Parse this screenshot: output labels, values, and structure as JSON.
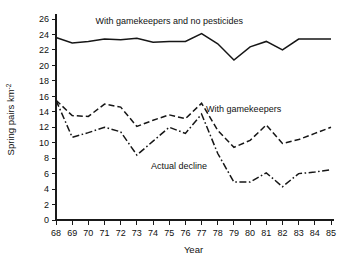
{
  "chart_data": {
    "type": "line",
    "title": "",
    "xlabel": "Year",
    "ylabel": "Spring pairs km",
    "ylabel_sup": "-2",
    "xlim": [
      68,
      85
    ],
    "ylim": [
      0,
      26
    ],
    "yticks": [
      0,
      2,
      4,
      6,
      8,
      10,
      12,
      14,
      16,
      18,
      20,
      22,
      24,
      26
    ],
    "ytick_labels": [
      "0",
      "2",
      "4",
      "6",
      "8",
      "10",
      "12",
      "14",
      "16",
      "18",
      "20",
      "22",
      "24",
      "26"
    ],
    "xticks": [
      68,
      69,
      70,
      71,
      72,
      73,
      74,
      75,
      76,
      77,
      78,
      79,
      80,
      81,
      82,
      83,
      84,
      85
    ],
    "xtick_labels": [
      "68",
      "69",
      "70",
      "71",
      "72",
      "73",
      "74",
      "75",
      "76",
      "77",
      "78",
      "79",
      "80",
      "81",
      "82",
      "83",
      "84",
      "85"
    ],
    "grid": false,
    "legend_position": "inline-annotations",
    "series": [
      {
        "name": "With gamekeepers and no pesticides",
        "style": "solid",
        "color": "#161616",
        "x": [
          68,
          69,
          70,
          71,
          72,
          73,
          74,
          75,
          76,
          77,
          78,
          79,
          80,
          81,
          82,
          83,
          84,
          85
        ],
        "values": [
          23.6,
          22.9,
          23.1,
          23.4,
          23.3,
          23.5,
          23.0,
          23.1,
          23.1,
          24.1,
          22.8,
          20.7,
          22.4,
          23.1,
          22.0,
          23.4,
          23.4,
          23.4
        ]
      },
      {
        "name": "With gamekeepers",
        "style": "dashed",
        "color": "#161616",
        "x": [
          68,
          69,
          70,
          71,
          72,
          73,
          74,
          75,
          76,
          77,
          78,
          79,
          80,
          81,
          82,
          83,
          84,
          85
        ],
        "values": [
          15.5,
          13.5,
          13.4,
          15.0,
          14.6,
          12.1,
          12.9,
          13.6,
          13.1,
          15.1,
          11.6,
          9.4,
          10.3,
          12.3,
          9.9,
          10.4,
          11.2,
          12.0
        ]
      },
      {
        "name": "Actual decline",
        "style": "dashdot",
        "color": "#161616",
        "x": [
          68,
          69,
          70,
          71,
          72,
          73,
          74,
          75,
          76,
          77,
          78,
          79,
          80,
          81,
          82,
          83,
          84,
          85
        ],
        "values": [
          15.5,
          10.7,
          11.3,
          12.0,
          11.4,
          8.4,
          10.2,
          12.0,
          11.2,
          13.7,
          8.6,
          4.9,
          4.9,
          6.1,
          4.3,
          6.0,
          6.2,
          6.5
        ]
      }
    ],
    "annotations": [
      {
        "text": "With gamekeepers and no pesticides",
        "x": 75.0,
        "y": 25.4,
        "anchor": "middle"
      },
      {
        "text": "With gamekeepers",
        "x": 79.6,
        "y": 14.0,
        "anchor": "middle"
      },
      {
        "text": "Actual decline",
        "x": 75.6,
        "y": 6.6,
        "anchor": "middle"
      }
    ]
  }
}
